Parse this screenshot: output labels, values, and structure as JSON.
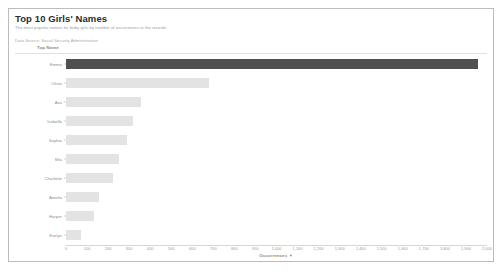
{
  "header": {
    "title": "Top 10 Girls' Names",
    "subtitle": "The most popular names for baby girls by number of occurrences in the records",
    "source_note": "Data Source: Social Security Administration"
  },
  "chart_data": {
    "type": "bar",
    "orientation": "horizontal",
    "title": "Top 10 Girls' Names",
    "xlabel": "Occurrences",
    "ylabel": "Top Name",
    "sort": "descending",
    "grid": false,
    "legend": false,
    "xlim": [
      0,
      2000
    ],
    "xticks": [
      "0",
      "100",
      "200",
      "300",
      "400",
      "500",
      "600",
      "700",
      "800",
      "900",
      "1,000",
      "1,100",
      "1,200",
      "1,300",
      "1,400",
      "1,500",
      "1,600",
      "1,700",
      "1,800",
      "1,900",
      "2,000"
    ],
    "categories": [
      "Emma",
      "Olivia",
      "Ava",
      "Isabella",
      "Sophia",
      "Mia",
      "Charlotte",
      "Amelia",
      "Harper",
      "Evelyn"
    ],
    "values": [
      1955,
      680,
      357,
      319,
      290,
      253,
      224,
      155,
      131,
      71
    ],
    "highlight_index": 0,
    "colors": {
      "bar": "#e3e3e3",
      "bar_highlight": "#4f4f4f",
      "axis": "#d6d6d6",
      "text": "#8d8d8d"
    }
  },
  "axis": {
    "y_field_header": "Top Name",
    "x_title": "Occurrences",
    "sort_glyph": "▼"
  }
}
